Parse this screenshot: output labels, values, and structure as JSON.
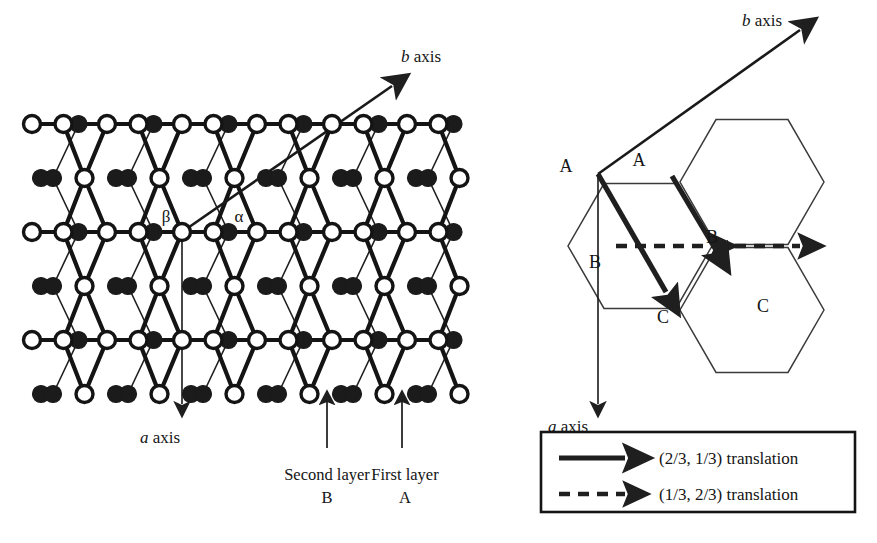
{
  "figure": {
    "background": "#ffffff",
    "ink": "#1a1a1a"
  },
  "left_panel": {
    "name": "stacked-layer-lattice",
    "b_axis_label": {
      "symbol": "b",
      "word": " axis"
    },
    "a_axis_label": {
      "symbol": "a",
      "word": " axis"
    },
    "site_labels": [
      {
        "text": "β",
        "x": 166,
        "y": 222,
        "site": "open-circle-origin"
      },
      {
        "text": "α",
        "x": 239,
        "y": 222,
        "site": "filled-circle"
      }
    ],
    "callouts": [
      {
        "line1": "Second layer",
        "line2": "B",
        "arrow_x": 327,
        "text_cx": 327,
        "target": "filled-circle"
      },
      {
        "line1": "First layer",
        "line2": "A",
        "arrow_x": 402,
        "text_cx": 405,
        "target": "open-circle"
      }
    ],
    "b_axis": {
      "x1": 182,
      "y1": 232,
      "x2": 392,
      "y2": 86
    },
    "a_axis": {
      "x1": 182,
      "y1": 232,
      "x2": 182,
      "y2": 404
    },
    "lattice": {
      "origin_x": 182,
      "origin_y": 232,
      "col_step": 75,
      "row_step": 54,
      "open_circle_radius": 8.5,
      "filled_circle_radius": 8.5,
      "rows": 6,
      "cols": 7
    }
  },
  "right_panel": {
    "name": "abc-stacking-translation",
    "b_axis_label": {
      "symbol": "b",
      "word": " axis"
    },
    "a_axis_label": {
      "symbol": "a",
      "word": " axis"
    },
    "vertex_labels": [
      {
        "text": "A",
        "x": 566,
        "y": 172
      },
      {
        "text": "A",
        "x": 639,
        "y": 166
      },
      {
        "text": "B",
        "x": 595,
        "y": 268
      },
      {
        "text": "B",
        "x": 712,
        "y": 243
      },
      {
        "text": "C",
        "x": 663,
        "y": 323
      },
      {
        "text": "C",
        "x": 763,
        "y": 312
      }
    ],
    "b_axis": {
      "x1": 598,
      "y1": 174,
      "x2": 800,
      "y2": 30
    },
    "a_axis": {
      "x1": 598,
      "y1": 174,
      "x2": 598,
      "y2": 404
    },
    "hexagons": [
      {
        "cx": 640,
        "cy": 246,
        "r": 72
      },
      {
        "cx": 752,
        "cy": 182,
        "r": 72
      },
      {
        "cx": 752,
        "cy": 310,
        "r": 72
      }
    ],
    "solid_arrows": [
      {
        "x1": 598,
        "y1": 174,
        "x2": 666,
        "y2": 292
      },
      {
        "x1": 672,
        "y1": 176,
        "x2": 716,
        "y2": 250
      }
    ],
    "dashed_arrows": [
      {
        "x1": 616,
        "y1": 246,
        "x2": 712,
        "y2": 246
      },
      {
        "x1": 716,
        "y1": 246,
        "x2": 800,
        "y2": 246
      }
    ]
  },
  "legend": {
    "name": "translation-legend",
    "box": {
      "x": 541,
      "y": 432,
      "w": 314,
      "h": 80
    },
    "entries": [
      {
        "style": "solid",
        "label": "(2/3, 1/3) translation"
      },
      {
        "style": "dashed",
        "label": "(1/3, 2/3) translation"
      }
    ]
  }
}
